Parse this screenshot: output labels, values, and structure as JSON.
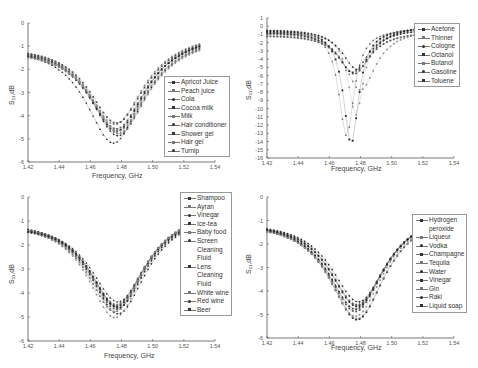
{
  "chart_data": [
    {
      "type": "scatter",
      "panel": "top-left",
      "xlabel": "Frequency, GHz",
      "ylabel": "S11, dB",
      "xlim": [
        1.42,
        1.54
      ],
      "ylim": [
        -6,
        0
      ],
      "xticks": [
        "1.42",
        "1.44",
        "1.46",
        "1.48",
        "1.50",
        "1.52",
        "1.54"
      ],
      "yticks": [
        "0",
        "-1",
        "-2",
        "-3",
        "-4",
        "-5",
        "-6"
      ],
      "legend_position": "right",
      "series": [
        {
          "name": "Apricot Juice",
          "f0": 1.477,
          "min": -4.9,
          "start": -0.85
        },
        {
          "name": "Peach juice",
          "f0": 1.478,
          "min": -5.0,
          "start": -0.9
        },
        {
          "name": "Cola",
          "f0": 1.476,
          "min": -4.6,
          "start": -0.8
        },
        {
          "name": "Cocoa milk",
          "f0": 1.478,
          "min": -5.1,
          "start": -0.95
        },
        {
          "name": "Milk",
          "f0": 1.477,
          "min": -4.8,
          "start": -0.9
        },
        {
          "name": "Hair conditioner",
          "f0": 1.479,
          "min": -5.0,
          "start": -1.0
        },
        {
          "name": "Shower gel",
          "f0": 1.475,
          "min": -5.4,
          "start": -0.8
        },
        {
          "name": "Hair gel",
          "f0": 1.477,
          "min": -4.55,
          "start": -0.85
        },
        {
          "name": "Turnip",
          "f0": 1.478,
          "min": -4.9,
          "start": -1.0
        }
      ]
    },
    {
      "type": "scatter",
      "panel": "top-right",
      "xlabel": "Frequency, GHz",
      "ylabel": "S11, dB",
      "xlim": [
        1.42,
        1.54
      ],
      "ylim": [
        -16,
        1
      ],
      "xticks": [
        "1.42",
        "1.44",
        "1.46",
        "1.48",
        "1.50",
        "1.52",
        "1.54"
      ],
      "yticks": [
        "1",
        "0",
        "-1",
        "-2",
        "-3",
        "-4",
        "-5",
        "-6",
        "-7",
        "-8",
        "-9",
        "-10",
        "-11",
        "-12",
        "-13",
        "-14",
        "-15",
        "-16"
      ],
      "legend_position": "upper right",
      "series": [
        {
          "name": "Acetone",
          "f0": 1.474,
          "min": -14.5,
          "start": -0.5
        },
        {
          "name": "Thinner",
          "f0": 1.471,
          "min": -13.5,
          "start": -0.6
        },
        {
          "name": "Cologne",
          "f0": 1.477,
          "min": -11.0,
          "start": -0.8
        },
        {
          "name": "Octanol",
          "f0": 1.478,
          "min": -5.5,
          "start": -0.3
        },
        {
          "name": "Butanol",
          "f0": 1.476,
          "min": -6.0,
          "start": -1.0
        },
        {
          "name": "Gasoline",
          "f0": 1.48,
          "min": -8.0,
          "start": -0.7
        },
        {
          "name": "Toluene",
          "f0": 1.475,
          "min": -5.8,
          "start": -0.6
        }
      ]
    },
    {
      "type": "scatter",
      "panel": "bottom-left",
      "xlabel": "Frequency, GHz",
      "ylabel": "S11, dB",
      "xlim": [
        1.42,
        1.54
      ],
      "ylim": [
        -6,
        0
      ],
      "xticks": [
        "1.42",
        "1.44",
        "1.46",
        "1.48",
        "1.50",
        "1.52",
        "1.54"
      ],
      "yticks": [
        "0",
        "-1",
        "-2",
        "-3",
        "-4",
        "-5",
        "-6"
      ],
      "legend_position": "upper right",
      "series": [
        {
          "name": "Shampoo",
          "f0": 1.477,
          "min": -4.8,
          "start": -0.85
        },
        {
          "name": "Ayran",
          "f0": 1.476,
          "min": -5.0,
          "start": -0.9
        },
        {
          "name": "Vinegar",
          "f0": 1.477,
          "min": -4.7,
          "start": -0.9
        },
        {
          "name": "Ice-tea",
          "f0": 1.478,
          "min": -5.1,
          "start": -0.95
        },
        {
          "name": "Baby food",
          "f0": 1.477,
          "min": -4.9,
          "start": -0.9
        },
        {
          "name": "Screen Cleaning Fluid",
          "f0": 1.476,
          "min": -5.25,
          "start": -0.85
        },
        {
          "name": "Lens Cleaning Fluid",
          "f0": 1.478,
          "min": -4.6,
          "start": -0.95
        },
        {
          "name": "White wine",
          "f0": 1.477,
          "min": -4.75,
          "start": -0.9
        },
        {
          "name": "Red wine",
          "f0": 1.476,
          "min": -5.0,
          "start": -0.85
        },
        {
          "name": "Beer",
          "f0": 1.478,
          "min": -4.85,
          "start": -0.95
        }
      ]
    },
    {
      "type": "scatter",
      "panel": "bottom-right",
      "xlabel": "Frequency, GHz",
      "ylabel": "S11, dB",
      "xlim": [
        1.42,
        1.54
      ],
      "ylim": [
        -6,
        0
      ],
      "xticks": [
        "1.42",
        "1.44",
        "1.46",
        "1.48",
        "1.50",
        "1.52",
        "1.54"
      ],
      "yticks": [
        "0",
        "-1",
        "-2",
        "-3",
        "-4",
        "-5",
        "-6"
      ],
      "legend_position": "right",
      "series": [
        {
          "name": "Hydrogen peroxide",
          "f0": 1.478,
          "min": -5.45,
          "start": -0.9
        },
        {
          "name": "Liqueur",
          "f0": 1.478,
          "min": -4.8,
          "start": -0.9
        },
        {
          "name": "Vodka",
          "f0": 1.477,
          "min": -5.0,
          "start": -0.9
        },
        {
          "name": "Champagne",
          "f0": 1.479,
          "min": -4.7,
          "start": -0.9
        },
        {
          "name": "Tequila",
          "f0": 1.477,
          "min": -5.1,
          "start": -0.9
        },
        {
          "name": "Water",
          "f0": 1.478,
          "min": -5.4,
          "start": -0.9
        },
        {
          "name": "Vinegar",
          "f0": 1.477,
          "min": -5.0,
          "start": -0.9
        },
        {
          "name": "Gin",
          "f0": 1.478,
          "min": -4.85,
          "start": -0.9
        },
        {
          "name": "Raki",
          "f0": 1.477,
          "min": -5.3,
          "start": -0.9
        },
        {
          "name": "Liquid soap",
          "f0": 1.478,
          "min": -4.9,
          "start": -0.9
        }
      ]
    }
  ],
  "panels": [
    {
      "id": "top-left",
      "ylabel": "S₁₁,dB",
      "xlabel": "Frequency, GHz",
      "legend": [
        "Apricot Juice",
        "Peach juice",
        "Cola",
        "Cocoa milk",
        "Milk",
        "Hair conditioner",
        "Shower gel",
        "Hair gel",
        "Turnip"
      ]
    },
    {
      "id": "top-right",
      "ylabel": "S₁₁,dB",
      "xlabel": "Frequency, GHz",
      "legend": [
        "Acetone",
        "Thinner",
        "Cologne",
        "Octanol",
        "Butanol",
        "Gasoline",
        "Toluene"
      ]
    },
    {
      "id": "bottom-left",
      "ylabel": "S₁₁,dB",
      "xlabel": "Frequency, GHz",
      "legend": [
        "Shampoo",
        "Ayran",
        "Vinegar",
        "Ice-tea",
        "Baby food",
        "Screen\nCleaning\nFluid",
        "Lens\nCleaning\nFluid",
        "White wine",
        "Red wine",
        "Beer"
      ]
    },
    {
      "id": "bottom-right",
      "ylabel": "S₁₁,dB",
      "xlabel": "Frequency, GHz",
      "legend": [
        "Hydrogen\nperoxide",
        "Liqueur",
        "Vodka",
        "Champagne",
        "Tequila",
        "Water",
        "Vinegar",
        "Gin",
        "Raki",
        "Liquid soap"
      ]
    }
  ]
}
